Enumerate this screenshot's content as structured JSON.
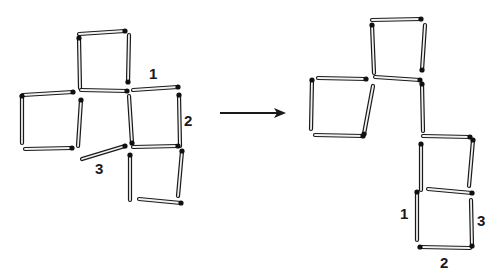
{
  "diagram": {
    "type": "matchstick-puzzle",
    "colors": {
      "stick_outline": "#1a1a1a",
      "stick_fill": "#f2f2f2",
      "head": "#111111",
      "arrow": "#1a1a1a",
      "background": "#ffffff"
    },
    "before": {
      "matches": [
        {
          "x1": 79,
          "y1": 34,
          "x2": 125,
          "y2": 31
        },
        {
          "x1": 80,
          "y1": 88,
          "x2": 79,
          "y2": 38
        },
        {
          "x1": 129,
          "y1": 35,
          "x2": 128,
          "y2": 82
        },
        {
          "x1": 81,
          "y1": 90,
          "x2": 127,
          "y2": 91
        },
        {
          "x1": 133,
          "y1": 90,
          "x2": 178,
          "y2": 87,
          "label": "1"
        },
        {
          "x1": 23,
          "y1": 95,
          "x2": 73,
          "y2": 92
        },
        {
          "x1": 22,
          "y1": 143,
          "x2": 22,
          "y2": 96
        },
        {
          "x1": 25,
          "y1": 149,
          "x2": 72,
          "y2": 148
        },
        {
          "x1": 78,
          "y1": 146,
          "x2": 81,
          "y2": 100
        },
        {
          "x1": 129,
          "y1": 96,
          "x2": 132,
          "y2": 143
        },
        {
          "x1": 180,
          "y1": 146,
          "x2": 179,
          "y2": 95,
          "label": "2"
        },
        {
          "x1": 82,
          "y1": 159,
          "x2": 125,
          "y2": 146,
          "label": "3"
        },
        {
          "x1": 133,
          "y1": 147,
          "x2": 178,
          "y2": 146
        },
        {
          "x1": 130,
          "y1": 200,
          "x2": 130,
          "y2": 155
        },
        {
          "x1": 178,
          "y1": 196,
          "x2": 182,
          "y2": 151
        },
        {
          "x1": 139,
          "y1": 199,
          "x2": 181,
          "y2": 203
        }
      ],
      "labels": [
        {
          "text": "1",
          "x": 149,
          "y": 66
        },
        {
          "text": "2",
          "x": 184,
          "y": 113
        },
        {
          "text": "3",
          "x": 95,
          "y": 161
        }
      ]
    },
    "arrow": {
      "x1": 220,
      "y1": 113,
      "x2": 286,
      "y2": 113
    },
    "after": {
      "matches": [
        {
          "x1": 372,
          "y1": 20,
          "x2": 421,
          "y2": 19
        },
        {
          "x1": 374,
          "y1": 73,
          "x2": 372,
          "y2": 25
        },
        {
          "x1": 425,
          "y1": 25,
          "x2": 422,
          "y2": 70
        },
        {
          "x1": 375,
          "y1": 77,
          "x2": 420,
          "y2": 80
        },
        {
          "x1": 318,
          "y1": 78,
          "x2": 366,
          "y2": 79
        },
        {
          "x1": 311,
          "y1": 129,
          "x2": 312,
          "y2": 80
        },
        {
          "x1": 315,
          "y1": 135,
          "x2": 363,
          "y2": 136
        },
        {
          "x1": 373,
          "y1": 86,
          "x2": 364,
          "y2": 134
        },
        {
          "x1": 423,
          "y1": 131,
          "x2": 422,
          "y2": 84
        },
        {
          "x1": 423,
          "y1": 136,
          "x2": 470,
          "y2": 137
        },
        {
          "x1": 421,
          "y1": 190,
          "x2": 421,
          "y2": 144
        },
        {
          "x1": 469,
          "y1": 186,
          "x2": 473,
          "y2": 140
        },
        {
          "x1": 428,
          "y1": 189,
          "x2": 472,
          "y2": 193
        },
        {
          "x1": 417,
          "y1": 240,
          "x2": 417,
          "y2": 192,
          "label": "1"
        },
        {
          "x1": 470,
          "y1": 248,
          "x2": 420,
          "y2": 247,
          "label": "2"
        },
        {
          "x1": 471,
          "y1": 200,
          "x2": 472,
          "y2": 246,
          "label": "3"
        }
      ],
      "labels": [
        {
          "text": "1",
          "x": 400,
          "y": 206
        },
        {
          "text": "2",
          "x": 440,
          "y": 255
        },
        {
          "text": "3",
          "x": 477,
          "y": 213
        }
      ]
    }
  }
}
